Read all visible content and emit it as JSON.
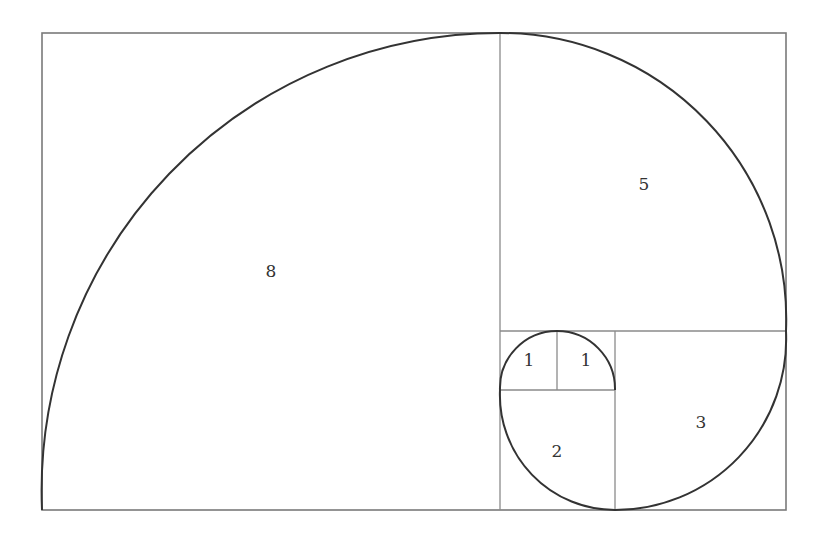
{
  "diagram": {
    "squares": [
      {
        "label": "8",
        "x": 42,
        "y": 33,
        "size": 458,
        "label_x": 271,
        "label_y": 272
      },
      {
        "label": "5",
        "x": 500,
        "y": 33,
        "size": 286,
        "label_x": 644,
        "label_y": 185
      },
      {
        "label": "3",
        "x": 615,
        "y": 331,
        "size": 171,
        "label_x": 701,
        "label_y": 423
      },
      {
        "label": "2",
        "x": 500,
        "y": 390,
        "size": 115,
        "label_x": 557,
        "label_y": 452
      },
      {
        "label": "1",
        "x": 500,
        "y": 331,
        "size": 57,
        "label_x": 529,
        "label_y": 361
      },
      {
        "label": "1",
        "x": 557,
        "y": 331,
        "size": 58,
        "label_x": 586,
        "label_y": 361
      }
    ],
    "colors": {
      "lines": "#8a8a8a",
      "spiral": "#333333",
      "background": "#ffffff"
    }
  }
}
